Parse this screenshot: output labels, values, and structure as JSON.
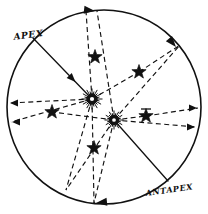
{
  "figure": {
    "title": "",
    "background_color": "#ffffff",
    "ink_color": "#111111",
    "width": 208,
    "height": 214,
    "labels": [
      {
        "id": "apex-label",
        "text": "APEX",
        "x": 14,
        "y": 40,
        "rotation": -8,
        "font_size": 9
      },
      {
        "id": "antapex-label",
        "text": "ANTAPEX",
        "x": 146,
        "y": 196,
        "rotation": -8,
        "font_size": 8
      }
    ],
    "boundary_circle": {
      "cx": 104,
      "cy": 107,
      "r": 97,
      "stroke_width": 1.6,
      "style": "solid"
    },
    "suns": [
      {
        "id": "sun-primary",
        "cx": 92,
        "cy": 99,
        "core_r": 3.4,
        "ring_r": 5.2,
        "spike_r": 10.5,
        "spikes": 24
      },
      {
        "id": "sun-secondary",
        "cx": 114,
        "cy": 120,
        "core_r": 3.0,
        "ring_r": 4.6,
        "spike_r": 9.5,
        "spikes": 24
      }
    ],
    "stars": [
      {
        "id": "star-upper-center",
        "cx": 95,
        "cy": 57,
        "r": 7.5
      },
      {
        "id": "star-upper-right",
        "cx": 139,
        "cy": 72,
        "r": 7.5
      },
      {
        "id": "star-left",
        "cx": 52,
        "cy": 112,
        "r": 7.5
      },
      {
        "id": "star-right",
        "cx": 146,
        "cy": 116,
        "r": 7.5
      },
      {
        "id": "star-lower-center",
        "cx": 94,
        "cy": 148,
        "r": 7.5
      }
    ],
    "tick_marks": [
      {
        "id": "tick-right-star",
        "x1": 141,
        "y1": 109,
        "x2": 151,
        "y2": 109
      }
    ],
    "solid_lines": [
      {
        "id": "apex-ray",
        "x1": 33,
        "y1": 38,
        "x2": 92,
        "y2": 99,
        "arrow_at": "end",
        "stroke_width": 1.3
      },
      {
        "id": "antapex-ray",
        "x1": 114,
        "y1": 120,
        "x2": 168,
        "y2": 181,
        "arrow_at": "none",
        "stroke_width": 1.3
      }
    ],
    "dashed_lines": [
      {
        "id": "dash-sun1-top",
        "x1": 92,
        "y1": 99,
        "x2": 86,
        "y2": 11
      },
      {
        "id": "dash-sun1-upper-right-star",
        "x1": 92,
        "y1": 99,
        "x2": 139,
        "y2": 72
      },
      {
        "id": "dash-sun1-far-upper-right",
        "x1": 139,
        "y1": 72,
        "x2": 180,
        "y2": 45
      },
      {
        "id": "dash-sun1-left",
        "x1": 92,
        "y1": 99,
        "x2": 9,
        "y2": 103
      },
      {
        "id": "dash-sun1-lower-left",
        "x1": 92,
        "y1": 99,
        "x2": 11,
        "y2": 122
      },
      {
        "id": "dash-sun1-lower-center",
        "x1": 92,
        "y1": 99,
        "x2": 66,
        "y2": 190
      },
      {
        "id": "dash-sun1-down",
        "x1": 92,
        "y1": 99,
        "x2": 94,
        "y2": 203
      },
      {
        "id": "dash-sun2-top",
        "x1": 114,
        "y1": 120,
        "x2": 97,
        "y2": 11
      },
      {
        "id": "dash-sun2-upper-right",
        "x1": 114,
        "y1": 120,
        "x2": 180,
        "y2": 45
      },
      {
        "id": "dash-sun2-right-star",
        "x1": 114,
        "y1": 120,
        "x2": 146,
        "y2": 116
      },
      {
        "id": "dash-sun2-far-right",
        "x1": 146,
        "y1": 116,
        "x2": 198,
        "y2": 108
      },
      {
        "id": "dash-sun2-lower-right",
        "x1": 114,
        "y1": 120,
        "x2": 196,
        "y2": 127
      },
      {
        "id": "dash-sun2-left-star",
        "x1": 114,
        "y1": 120,
        "x2": 52,
        "y2": 112
      },
      {
        "id": "dash-sun2-lower-center",
        "x1": 114,
        "y1": 120,
        "x2": 94,
        "y2": 203
      },
      {
        "id": "dash-sun2-bottom-left",
        "x1": 114,
        "y1": 120,
        "x2": 66,
        "y2": 190
      }
    ],
    "circle_arrowheads": [
      {
        "id": "arrow-top",
        "cx": 95,
        "cy": 11,
        "angle": 6
      },
      {
        "id": "arrow-upper-right",
        "cx": 176,
        "cy": 47,
        "angle": 50
      },
      {
        "id": "arrow-bottom",
        "cx": 96,
        "cy": 203,
        "angle": 174
      }
    ],
    "edge_arrowheads": [
      {
        "id": "arrow-left-upper",
        "x": 10,
        "y": 103,
        "dir": "left"
      },
      {
        "id": "arrow-left-lower",
        "x": 12,
        "y": 122,
        "dir": "left"
      },
      {
        "id": "arrow-right-upper",
        "x": 197,
        "y": 108,
        "dir": "right"
      },
      {
        "id": "arrow-right-lower",
        "x": 195,
        "y": 127,
        "dir": "right"
      }
    ]
  }
}
